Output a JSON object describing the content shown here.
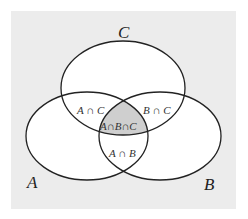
{
  "diagram": {
    "type": "venn",
    "background_color": "#ececec",
    "circle_fill": "#ffffff",
    "stroke_color": "#222222",
    "highlight_fill": "#cfcfcf",
    "sets": [
      {
        "id": "A",
        "label": "A"
      },
      {
        "id": "B",
        "label": "B"
      },
      {
        "id": "C",
        "label": "C"
      }
    ],
    "regions": {
      "a_and_c": "A ∩ C",
      "b_and_c": "B ∩ C",
      "a_and_b_and_c": "A∩B∩C",
      "a_and_b": "A ∩ B"
    },
    "highlighted_region": "A∩B∩C"
  }
}
